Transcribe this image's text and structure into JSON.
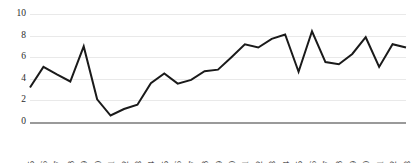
{
  "chart_data": {
    "type": "line",
    "title": "",
    "subtitle": "",
    "xlabel": "",
    "ylabel": "",
    "grid": true,
    "legend": "none",
    "xlim": [
      1985,
      2013
    ],
    "ylim": [
      0,
      10
    ],
    "y_ticks": [
      0,
      2,
      4,
      6,
      8,
      10
    ],
    "categories": [
      "1985",
      "1986",
      "1987",
      "1988",
      "1989",
      "1990",
      "1991",
      "1992",
      "1993",
      "1994",
      "1995",
      "1996",
      "1997",
      "1998",
      "1999",
      "2000",
      "2001",
      "2002",
      "2003",
      "2004",
      "2005",
      "2006",
      "2007",
      "2008",
      "2009",
      "2010",
      "2011",
      "2012",
      "2013"
    ],
    "values": [
      3.2,
      5.1,
      4.4,
      3.75,
      7.0,
      2.1,
      0.6,
      1.2,
      1.6,
      3.6,
      4.5,
      3.55,
      3.9,
      4.7,
      4.85,
      6.0,
      7.2,
      6.9,
      7.7,
      8.1,
      4.65,
      8.4,
      5.55,
      5.35,
      6.3,
      7.85,
      5.1,
      7.2,
      6.9
    ],
    "series": [
      {
        "name": "series-1",
        "color": "#1a1a1a",
        "values": [
          3.2,
          5.1,
          4.4,
          3.75,
          7.0,
          2.1,
          0.6,
          1.2,
          1.6,
          3.6,
          4.5,
          3.55,
          3.9,
          4.7,
          4.85,
          6.0,
          7.2,
          6.9,
          7.7,
          8.1,
          4.65,
          8.4,
          5.55,
          5.35,
          6.3,
          7.85,
          5.1,
          7.2,
          6.9
        ]
      }
    ],
    "colors": {
      "line": "#1a1a1a",
      "gridline": "#e9e9e9",
      "axis": "#9a9a9a",
      "text": "#2b2b2b",
      "background": "#ffffff"
    }
  }
}
